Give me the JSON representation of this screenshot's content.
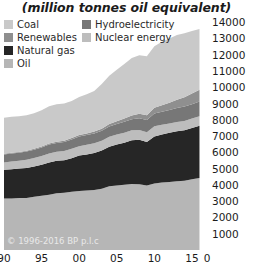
{
  "title": "(million tonnes oil equivalent)",
  "copyright": "© 1996-2016 BP p.l.c",
  "legend": {
    "column_left": [
      {
        "label": "Coal",
        "color": "#c9c9c9",
        "icon": "legend-swatch-icon"
      },
      {
        "label": "Renewables",
        "color": "#8f8f8f",
        "icon": "legend-swatch-icon"
      },
      {
        "label": "Natural gas",
        "color": "#262626",
        "icon": "legend-swatch-icon"
      },
      {
        "label": "Oil",
        "color": "#b6b6b6",
        "icon": "legend-swatch-icon"
      }
    ],
    "column_right": [
      {
        "label": "Hydroelectricity",
        "color": "#777777",
        "icon": "legend-swatch-icon"
      },
      {
        "label": "Nuclear energy",
        "color": "#bdbdbd",
        "icon": "legend-swatch-icon"
      }
    ]
  },
  "chart_data": {
    "type": "area",
    "title": "(million tonnes oil equivalent)",
    "subtitle": "",
    "xlabel": "",
    "ylabel": "",
    "stacked": true,
    "grid": false,
    "legend_position": "top-left",
    "ylim": [
      0,
      14500
    ],
    "yticks": [
      1000,
      2000,
      3000,
      4000,
      5000,
      6000,
      7000,
      8000,
      9000,
      10000,
      11000,
      12000,
      13000,
      14000
    ],
    "ytick_labels": [
      "1000",
      "2000",
      "3000",
      "4000",
      "5000",
      "6000",
      "7000",
      "8000",
      "9000",
      "10000",
      "11000",
      "12000",
      "13000",
      "14000"
    ],
    "xlim": [
      1990,
      2017
    ],
    "xticks": [
      1990,
      1995,
      2000,
      2005,
      2010,
      2015,
      2017
    ],
    "xtick_labels": [
      "90",
      "95",
      "00",
      "05",
      "10",
      "15",
      "0"
    ],
    "x": [
      1990,
      1991,
      1992,
      1993,
      1994,
      1995,
      1996,
      1997,
      1998,
      1999,
      2000,
      2001,
      2002,
      2003,
      2004,
      2005,
      2006,
      2007,
      2008,
      2009,
      2010,
      2011,
      2012,
      2013,
      2014,
      2015,
      2016
    ],
    "series": [
      {
        "name": "Oil",
        "color": "#b6b6b6",
        "values": [
          3160,
          3160,
          3200,
          3200,
          3270,
          3330,
          3400,
          3490,
          3510,
          3580,
          3620,
          3650,
          3680,
          3760,
          3910,
          3970,
          4010,
          4060,
          4040,
          3960,
          4090,
          4140,
          4180,
          4220,
          4260,
          4350,
          4420
        ]
      },
      {
        "name": "Natural gas",
        "color": "#262626",
        "values": [
          1770,
          1800,
          1810,
          1840,
          1860,
          1910,
          1980,
          1990,
          2010,
          2060,
          2180,
          2220,
          2280,
          2360,
          2440,
          2510,
          2580,
          2680,
          2730,
          2670,
          2890,
          2960,
          3030,
          3080,
          3100,
          3150,
          3210
        ]
      },
      {
        "name": "Nuclear energy",
        "color": "#bdbdbd",
        "values": [
          450,
          470,
          480,
          500,
          520,
          530,
          550,
          550,
          560,
          580,
          580,
          600,
          600,
          590,
          610,
          610,
          620,
          610,
          610,
          610,
          630,
          600,
          560,
          560,
          570,
          580,
          590
        ]
      },
      {
        "name": "Hydroelectricity",
        "color": "#777777",
        "values": [
          490,
          500,
          490,
          510,
          510,
          530,
          550,
          550,
          560,
          570,
          590,
          590,
          600,
          610,
          630,
          650,
          670,
          690,
          720,
          740,
          780,
          790,
          830,
          860,
          880,
          880,
          910
        ]
      },
      {
        "name": "Renewables",
        "color": "#8f8f8f",
        "values": [
          40,
          45,
          48,
          52,
          56,
          60,
          65,
          70,
          76,
          84,
          95,
          105,
          118,
          133,
          150,
          172,
          198,
          230,
          265,
          300,
          350,
          400,
          450,
          510,
          580,
          650,
          720
        ]
      },
      {
        "name": "Coal",
        "color": "#c9c9c9",
        "values": [
          2220,
          2210,
          2190,
          2180,
          2190,
          2230,
          2290,
          2310,
          2290,
          2280,
          2340,
          2400,
          2490,
          2750,
          2960,
          3160,
          3350,
          3520,
          3600,
          3620,
          3780,
          3900,
          3950,
          3980,
          3930,
          3840,
          3730
        ]
      }
    ],
    "totals_note": "stacked order bottom-to-top: Oil, Natural gas, Nuclear energy, Hydroelectricity, Renewables, Coal"
  }
}
